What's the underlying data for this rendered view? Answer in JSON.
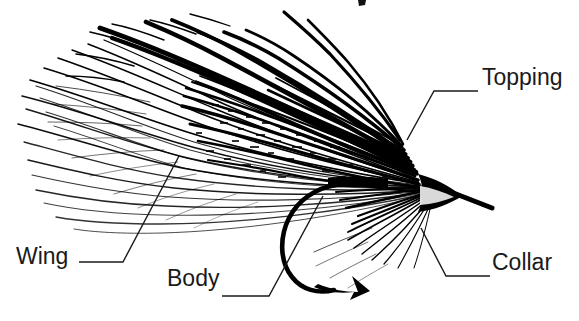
{
  "figure": {
    "background_color": "#ffffff",
    "ink_color": "#000000",
    "text_color": "#1a1a1a"
  },
  "labels": [
    {
      "id": "topping",
      "text": "Topping"
    },
    {
      "id": "collar",
      "text": "Collar"
    },
    {
      "id": "wing",
      "text": "Wing"
    },
    {
      "id": "body",
      "text": "Body"
    }
  ],
  "leaders": [
    {
      "id": "topping-leader",
      "for": "Topping"
    },
    {
      "id": "collar-leader",
      "for": "Collar"
    },
    {
      "id": "wing-leader",
      "for": "Wing"
    },
    {
      "id": "body-leader",
      "for": "Body"
    }
  ],
  "parts": [
    {
      "id": "topping-strands",
      "name": "topping"
    },
    {
      "id": "wing-fibers",
      "name": "wing"
    },
    {
      "id": "collar-fibers",
      "name": "collar"
    },
    {
      "id": "hook",
      "name": "body"
    },
    {
      "id": "head",
      "name": "head"
    }
  ]
}
